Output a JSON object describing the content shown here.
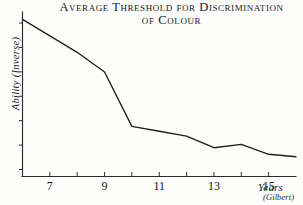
{
  "title": {
    "line1": "Average Threshold for Discrimination",
    "line2": "of Colour"
  },
  "axes": {
    "y_label": "Ability (Inverse)",
    "x_label": "Years",
    "source": "(Gilbert)"
  },
  "chart_data": {
    "type": "line",
    "title": "Average Threshold for Discrimination of Colour",
    "xlabel": "Years",
    "ylabel": "Ability (Inverse)",
    "xlim": [
      6,
      16
    ],
    "ylim": [
      0,
      10
    ],
    "grid": false,
    "legend": null,
    "source": "(Gilbert)",
    "x_tick_labels": [
      "7",
      "9",
      "11",
      "13",
      "15"
    ],
    "x_tick_values": [
      7,
      9,
      11,
      13,
      15
    ],
    "x_minor_ticks": [
      6,
      7,
      8,
      9,
      10,
      11,
      12,
      13,
      14,
      15,
      16
    ],
    "y_ticks_unlabeled": 7,
    "y_axis_note": "unlabeled inverse scale, high = poor discrimination",
    "series": [
      {
        "name": "Average threshold for colour discrimination",
        "x": [
          6,
          7,
          8,
          9,
          10,
          11,
          12,
          13,
          14,
          15,
          16
        ],
        "values": [
          9.55,
          8.55,
          7.55,
          6.35,
          3.05,
          2.75,
          2.45,
          1.75,
          1.95,
          1.35,
          1.2
        ]
      }
    ]
  }
}
